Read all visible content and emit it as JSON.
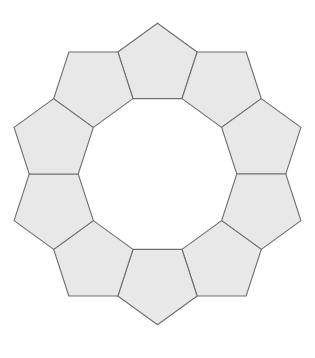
{
  "diagram": {
    "title": "",
    "shape": "regular-pentagon",
    "count": 10,
    "center": [
      157.5,
      174
    ],
    "edge_length": 49,
    "start_angle_deg": -90,
    "fill": "#e8e8e8",
    "stroke": "#6e6e6e",
    "background": "#ffffff"
  }
}
